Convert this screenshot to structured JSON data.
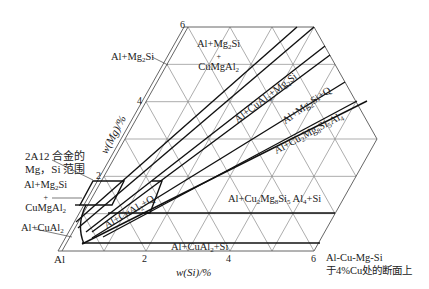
{
  "diagram": {
    "title": "Al-Cu-Mg-Si 于4%Cu处的断面上",
    "title_lines": [
      "Al-Cu-Mg-Si",
      "于4%Cu处的断面上"
    ],
    "origin_label": "Al",
    "x_axis": {
      "label": "w(Si)/%",
      "ticks": [
        "2",
        "4",
        "6"
      ]
    },
    "y_axis": {
      "label": "w(Mg)/%",
      "ticks": [
        "2",
        "4",
        "6"
      ]
    },
    "callout": {
      "lines": [
        "2A12 合金的",
        "Mg，Si 范围"
      ]
    },
    "regions": [
      {
        "id": "al-mg2si",
        "text": "Al+Mg₂Si"
      },
      {
        "id": "al-mg2si-cumgal2-top",
        "lines": [
          "Al+Mg₂Si",
          "+",
          "CuMgAl₂"
        ]
      },
      {
        "id": "al-cual2-mg2si",
        "text": "Al+CuAl₂+Mg₂Si"
      },
      {
        "id": "al-mg2si-q",
        "text": "Al+Mg₂Si+Q"
      },
      {
        "id": "al-cu2mg8si5al4",
        "text": "Al+Cu₂Mg₈Si₅Al₄"
      },
      {
        "id": "al-cu2mg8si5al4-si",
        "text": "Al+Cu₂Mg₈Si₅Al₄+Si"
      },
      {
        "id": "al-cual2-q",
        "text": "Al+CuAl₂+Q"
      },
      {
        "id": "al-cual2-si",
        "text": "Al+CuAl₂+Si"
      },
      {
        "id": "al-mg2si-cumgal2-left",
        "lines": [
          "Al+Mg₂Si",
          "+",
          "CuMgAl₂"
        ]
      },
      {
        "id": "al-cual2",
        "text": "Al+CuAl₂"
      }
    ]
  }
}
